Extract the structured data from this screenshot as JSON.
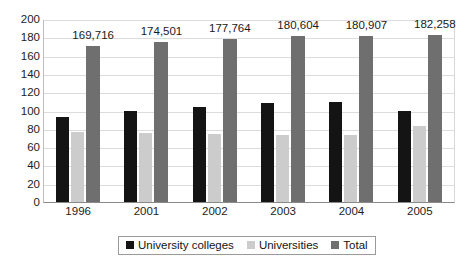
{
  "chart_data": {
    "type": "bar",
    "title": "",
    "subtitle": "",
    "xlabel": "",
    "ylabel": "",
    "ylim": [
      0,
      200
    ],
    "ytick_step": 20,
    "yticks": [
      200,
      180,
      160,
      140,
      120,
      100,
      80,
      60,
      40,
      20,
      0
    ],
    "grid": true,
    "legend_position": "bottom",
    "categories": [
      "1996",
      "2001",
      "2002",
      "2003",
      "2004",
      "2005"
    ],
    "series": [
      {
        "name": "University colleges",
        "color": "#141414",
        "values": [
          93,
          99,
          104,
          108,
          109,
          100
        ],
        "labels": [
          "",
          "",
          "",
          "",
          "",
          ""
        ]
      },
      {
        "name": "Universities",
        "color": "#cccccc",
        "values": [
          76,
          75,
          74,
          73,
          73,
          83
        ],
        "labels": [
          "",
          "",
          "",
          "",
          "",
          ""
        ]
      },
      {
        "name": "Total",
        "color": "#6f6f6f",
        "values": [
          170,
          175,
          178,
          181,
          181,
          182
        ],
        "labels": [
          "169,716",
          "174,501",
          "177,764",
          "180,604",
          "180,907",
          "182,258"
        ]
      }
    ]
  },
  "legend": {
    "items": [
      {
        "label": "University colleges",
        "swatch": "series-0-swatch"
      },
      {
        "label": "Universities",
        "swatch": "series-1-swatch"
      },
      {
        "label": "Total",
        "swatch": "series-2-swatch"
      }
    ]
  },
  "colors": {
    "series_0": "#141414",
    "series_1": "#cccccc",
    "series_2": "#6f6f6f",
    "gridline": "#dcdcdc",
    "axis": "#8a8a8a",
    "text": "#1b1b1b",
    "background": "#ffffff"
  }
}
